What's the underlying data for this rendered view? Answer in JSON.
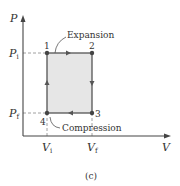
{
  "diagram": {
    "type": "pv-cycle",
    "caption": "(c)",
    "axes": {
      "y_label": "P",
      "x_label": "V"
    },
    "ticks": {
      "p_initial": {
        "main": "P",
        "sub": "i"
      },
      "p_final": {
        "main": "P",
        "sub": "f"
      },
      "v_initial": {
        "main": "V",
        "sub": "i"
      },
      "v_final": {
        "main": "V",
        "sub": "f"
      }
    },
    "points": [
      {
        "label": "1"
      },
      {
        "label": "2"
      },
      {
        "label": "3"
      },
      {
        "label": "4"
      }
    ],
    "annotations": {
      "expansion": "Expansion",
      "compression": "Compression"
    },
    "colors": {
      "fill": "#e6e6e6",
      "line": "#555555",
      "point": "#444444",
      "axis": "#444444",
      "text": "#333333"
    }
  }
}
